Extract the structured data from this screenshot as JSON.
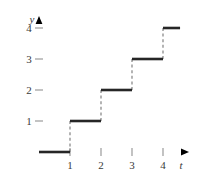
{
  "figure": {
    "name": "step-function-graph",
    "axis_labels": {
      "x": "t",
      "y": "y"
    },
    "x_ticks": [
      "1",
      "2",
      "3",
      "4"
    ],
    "y_ticks": [
      "1",
      "2",
      "3",
      "4"
    ],
    "colors": {
      "axis": "#9a9a9a",
      "curve": "#262626",
      "dashed": "#8c8c8c",
      "text": "#3a3a3a",
      "background": "#ffffff"
    }
  },
  "chart_data": {
    "type": "line",
    "title": "",
    "xlabel": "t",
    "ylabel": "y",
    "xlim": [
      -0.35,
      5.0
    ],
    "ylim": [
      -0.55,
      4.75
    ],
    "grid": false,
    "legend": null,
    "x_ticks": [
      1,
      2,
      3,
      4
    ],
    "y_ticks": [
      1,
      2,
      3,
      4
    ],
    "series": [
      {
        "name": "floor(t)",
        "style": "step-post",
        "segments": [
          {
            "y": 0,
            "x_start": 0.0,
            "x_end": 1.0,
            "line": "solid"
          },
          {
            "y": 1,
            "x_start": 1.0,
            "x_end": 2.0,
            "line": "solid"
          },
          {
            "y": 2,
            "x_start": 2.0,
            "x_end": 3.0,
            "line": "solid"
          },
          {
            "y": 3,
            "x_start": 3.0,
            "x_end": 4.0,
            "line": "solid"
          },
          {
            "y": 4,
            "x_start": 4.0,
            "x_end": 4.55,
            "line": "solid"
          }
        ],
        "risers": [
          {
            "x": 1.0,
            "y_start": 0,
            "y_end": 1,
            "line": "dashed"
          },
          {
            "x": 2.0,
            "y_start": 1,
            "y_end": 2,
            "line": "dashed"
          },
          {
            "x": 3.0,
            "y_start": 2,
            "y_end": 3,
            "line": "dashed"
          },
          {
            "x": 4.0,
            "y_start": 3,
            "y_end": 4,
            "line": "dashed"
          }
        ]
      }
    ]
  }
}
